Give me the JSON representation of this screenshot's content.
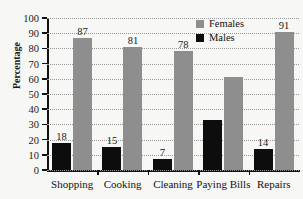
{
  "chart_data": {
    "type": "bar",
    "title": "",
    "xlabel": "",
    "ylabel": "Percentage",
    "ylim": [
      0,
      100
    ],
    "ytick_step": 10,
    "grid": true,
    "legend_position": "top-right",
    "categories": [
      "Shopping",
      "Cooking",
      "Cleaning",
      "Paying Bills",
      "Repairs"
    ],
    "series": [
      {
        "name": "Males",
        "color": "#0d0d0d",
        "values": [
          18,
          15,
          7,
          33,
          14
        ],
        "labels": [
          "18",
          "15",
          "7",
          "",
          "14"
        ]
      },
      {
        "name": "Females",
        "color": "#8e8e8e",
        "values": [
          87,
          81,
          78,
          61,
          91
        ],
        "labels": [
          "87",
          "81",
          "78",
          "",
          "91"
        ]
      }
    ],
    "yticks": [
      "0",
      "10",
      "20",
      "30",
      "40",
      "50",
      "60",
      "70",
      "80",
      "90",
      "100"
    ]
  },
  "legend": {
    "items": [
      {
        "label": "Females",
        "color": "#8e8e8e"
      },
      {
        "label": "Males",
        "color": "#0d0d0d"
      }
    ]
  }
}
